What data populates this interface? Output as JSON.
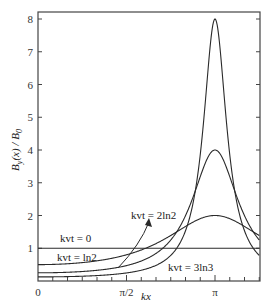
{
  "chart_data": {
    "type": "line",
    "title": "",
    "xlabel": "kx",
    "ylabel": "B_y(x)/B_0",
    "xlim": [
      0,
      3.927
    ],
    "ylim": [
      0,
      8.2
    ],
    "grid": false,
    "legend": "none (curve labels annotated inline)",
    "x_ticks": [
      {
        "value": 0,
        "label": "0"
      },
      {
        "value": 1.5708,
        "label": "π/2"
      },
      {
        "value": 3.1416,
        "label": "π"
      }
    ],
    "x_minor_ticks_per_pi": 12,
    "y_ticks": [
      {
        "value": 1,
        "label": "1"
      },
      {
        "value": 2,
        "label": "2"
      },
      {
        "value": 3,
        "label": "3"
      },
      {
        "value": 4,
        "label": "4"
      },
      {
        "value": 5,
        "label": "5"
      },
      {
        "value": 6,
        "label": "6"
      },
      {
        "value": 7,
        "label": "7"
      },
      {
        "value": 8,
        "label": "8"
      }
    ],
    "x": [
      0,
      0.3927,
      0.7854,
      1.1781,
      1.5708,
      1.9635,
      2.3562,
      2.7489,
      3.1416,
      3.5343,
      3.927
    ],
    "series": [
      {
        "name": "kvt=0",
        "label": "kvt = 0",
        "tau": 0,
        "values": [
          1,
          1,
          1,
          1,
          1,
          1,
          1,
          1,
          1,
          1,
          1
        ]
      },
      {
        "name": "kvt=ln2",
        "label": "kvt = ln2",
        "tau": 0.6931,
        "values": [
          0.5,
          0.53,
          0.63,
          0.82,
          1.0,
          1.32,
          1.6,
          1.88,
          2.0,
          1.88,
          1.6
        ]
      },
      {
        "name": "kvt=2ln2",
        "label": "kvt = 2ln2",
        "tau": 1.3863,
        "values": [
          0.25,
          0.27,
          0.34,
          0.52,
          0.94,
          1.73,
          2.79,
          3.67,
          4.0,
          3.67,
          2.79
        ]
      },
      {
        "name": "kvt=3ln3",
        "label": "kvt = 3ln3",
        "tau": 2.0794,
        "values": [
          0.125,
          0.135,
          0.18,
          0.31,
          0.5,
          1.53,
          3.87,
          6.84,
          8.0,
          6.84,
          3.87
        ]
      }
    ],
    "formula_note": "curves follow B/B0 = 1/(cosh τ + sinh τ cos kx), peaks at kx=π equal 1, 2, 4, 8",
    "annotations": [
      {
        "text": "kvt = 0",
        "x_px": 60,
        "y_px": 242
      },
      {
        "text": "kvt = ln2",
        "x_px": 57,
        "y_px": 260
      },
      {
        "text": "kvt = 2ln2",
        "x_px": 131,
        "y_px": 218,
        "arrow_to_px": [
          148,
          193
        ],
        "arrow_from_px": [
          118,
          269
        ]
      },
      {
        "text": "kvt = 3ln3",
        "x_px": 168,
        "y_px": 270
      }
    ]
  },
  "labels": {
    "ylabel_main": "B",
    "ylabel_sub": "y",
    "ylabel_rest": "(x) / B",
    "ylabel_sub2": "0",
    "xlabel": "kx",
    "curve_kvt0": "kvt = 0",
    "curve_ln2": "kvt = ln2",
    "curve_2ln2": "kvt = 2ln2",
    "curve_3ln3": "kvt = 3ln3"
  },
  "colors": {
    "axis": "#444444",
    "curve": "#2a2a2a",
    "background": "#ffffff"
  }
}
